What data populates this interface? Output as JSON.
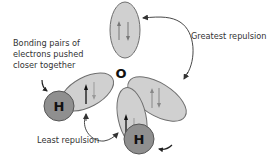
{
  "diagram": {
    "central_atom": {
      "label": "O"
    },
    "hydrogen_atoms": [
      {
        "label": "H"
      },
      {
        "label": "H"
      }
    ],
    "labels": {
      "bonding_note_line1": "Bonding pairs of",
      "bonding_note_line2": "electrons pushed",
      "bonding_note_line3": "closer together",
      "greatest_repulsion": "Greatest repulsion",
      "least_repulsion": "Least repulsion"
    },
    "electron_pairs": [
      {
        "type": "lone",
        "position": "top"
      },
      {
        "type": "lone",
        "position": "right"
      },
      {
        "type": "bonding",
        "position": "left",
        "bonded_to": "H"
      },
      {
        "type": "bonding",
        "position": "bottom",
        "bonded_to": "H"
      }
    ],
    "colors": {
      "orbital_fill": "#d0d0d0",
      "orbital_stroke": "#6e6e6e",
      "hydrogen_fill": "#8f8f8f",
      "hydrogen_stroke": "#555555",
      "arrow": "#333333",
      "text": "#333333"
    }
  }
}
